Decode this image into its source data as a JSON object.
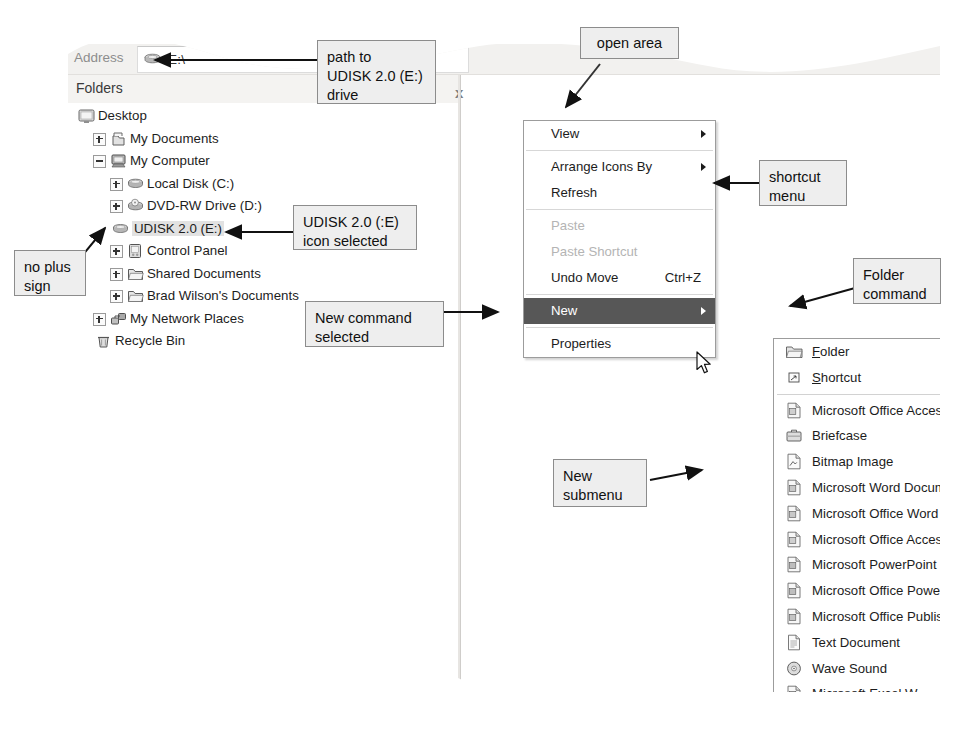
{
  "window": {
    "address_label": "Address",
    "address_value": "E:\\",
    "address_drive_icon": "usb-drive-icon",
    "folders_pane_title": "Folders",
    "collapse_chevron": "x"
  },
  "tree": {
    "items": [
      {
        "label": "Desktop",
        "indent": 0,
        "expander": "none",
        "icon": "desktop-icon",
        "selected": false
      },
      {
        "label": "My Documents",
        "indent": 1,
        "expander": "plus",
        "icon": "my-documents-icon",
        "selected": false
      },
      {
        "label": "My Computer",
        "indent": 1,
        "expander": "minus",
        "icon": "my-computer-icon",
        "selected": false
      },
      {
        "label": "Local Disk (C:)",
        "indent": 2,
        "expander": "plus",
        "icon": "hard-disk-icon",
        "selected": false
      },
      {
        "label": "DVD-RW Drive (D:)",
        "indent": 2,
        "expander": "plus",
        "icon": "dvd-drive-icon",
        "selected": false
      },
      {
        "label": "UDISK 2.0 (E:)",
        "indent": 2,
        "expander": "none",
        "icon": "usb-drive-icon",
        "selected": true
      },
      {
        "label": "Control Panel",
        "indent": 2,
        "expander": "plus",
        "icon": "control-panel-icon",
        "selected": false
      },
      {
        "label": "Shared Documents",
        "indent": 2,
        "expander": "plus",
        "icon": "folder-icon",
        "selected": false
      },
      {
        "label": "Brad Wilson's Documents",
        "indent": 2,
        "expander": "plus",
        "icon": "folder-icon",
        "selected": false
      },
      {
        "label": "My Network Places",
        "indent": 1,
        "expander": "plus",
        "icon": "network-icon",
        "selected": false
      },
      {
        "label": "Recycle Bin",
        "indent": 1,
        "expander": "none",
        "icon": "recycle-bin-icon",
        "selected": false
      }
    ]
  },
  "shortcut_menu": {
    "items": [
      {
        "label": "View",
        "accel": "",
        "state": "normal",
        "submenu_arrow": true,
        "separator_after": true
      },
      {
        "label": "Arrange Icons By",
        "accel": "",
        "state": "normal",
        "submenu_arrow": true,
        "separator_after": false
      },
      {
        "label": "Refresh",
        "accel": "",
        "state": "normal",
        "submenu_arrow": false,
        "separator_after": true
      },
      {
        "label": "Paste",
        "accel": "",
        "state": "disabled",
        "submenu_arrow": false,
        "separator_after": false
      },
      {
        "label": "Paste Shortcut",
        "accel": "",
        "state": "disabled",
        "submenu_arrow": false,
        "separator_after": false
      },
      {
        "label": "Undo Move",
        "accel": "Ctrl+Z",
        "state": "normal",
        "submenu_arrow": false,
        "separator_after": true
      },
      {
        "label": "New",
        "accel": "",
        "state": "highlighted",
        "submenu_arrow": true,
        "separator_after": true
      },
      {
        "label": "Properties",
        "accel": "",
        "state": "normal",
        "submenu_arrow": false,
        "separator_after": false
      }
    ]
  },
  "new_submenu": {
    "items": [
      {
        "label": "Folder",
        "mnemonic": "F",
        "icon": "folder-icon",
        "separator_after": false
      },
      {
        "label": "Shortcut",
        "mnemonic": "S",
        "icon": "shortcut-icon",
        "separator_after": true
      },
      {
        "label": "Microsoft Office Access 12 (Beta)",
        "mnemonic": "",
        "icon": "access-icon",
        "separator_after": false
      },
      {
        "label": "Briefcase",
        "mnemonic": "",
        "icon": "briefcase-icon",
        "separator_after": false
      },
      {
        "label": "Bitmap Image",
        "mnemonic": "",
        "icon": "bitmap-icon",
        "separator_after": false
      },
      {
        "label": "Microsoft Word Document",
        "mnemonic": "",
        "icon": "word-icon",
        "separator_after": false
      },
      {
        "label": "Microsoft Office Word 2007 Document",
        "mnemonic": "",
        "icon": "word2007-icon",
        "separator_after": false
      },
      {
        "label": "Microsoft Office Access Application",
        "mnemonic": "",
        "icon": "access-icon",
        "separator_after": false
      },
      {
        "label": "Microsoft PowerPoint Presentation",
        "mnemonic": "",
        "icon": "powerpoint-icon",
        "separator_after": false
      },
      {
        "label": "Microsoft Office PowerPoint 2007 Pr",
        "mnemonic": "",
        "icon": "powerpoint-icon",
        "separator_after": false
      },
      {
        "label": "Microsoft Office Publisher Document",
        "mnemonic": "",
        "icon": "publisher-icon",
        "separator_after": false
      },
      {
        "label": "Text Document",
        "mnemonic": "",
        "icon": "text-file-icon",
        "separator_after": false
      },
      {
        "label": "Wave Sound",
        "mnemonic": "",
        "icon": "wave-sound-icon",
        "separator_after": false
      },
      {
        "label": "Microsoft Excel Worksheet",
        "mnemonic": "",
        "icon": "excel-icon",
        "separator_after": false
      },
      {
        "label": "Microsoft Office Excel 2007 Workshe",
        "mnemonic": "",
        "icon": "excel2007-icon",
        "separator_after": false
      },
      {
        "label": "Compressed (zipped) Folder",
        "mnemonic": "",
        "icon": "zip-folder-icon",
        "separator_after": false
      }
    ]
  },
  "callouts": {
    "path_to_drive": "path to\nUDISK 2.0 (E:)\ndrive",
    "open_area": "open area",
    "shortcut_menu": "shortcut\nmenu",
    "udisk_selected": "UDISK 2.0 (:E)\nicon selected",
    "no_plus_sign": "no plus\nsign",
    "new_command_selected": "New command\nselected",
    "folder_command": "Folder\ncommand",
    "new_submenu": "New\nsubmenu"
  },
  "colors": {
    "highlight": "#575757",
    "callout_fill": "#eeeeee",
    "chrome": "#f2f1ef",
    "selection": "#e2e2e2"
  }
}
